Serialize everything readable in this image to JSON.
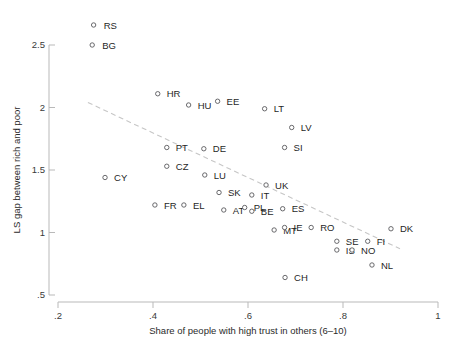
{
  "chart_data": {
    "type": "scatter",
    "title": "",
    "xlabel": "Share of people with high trust in others (6–10)",
    "ylabel": "LS gap between rich and poor",
    "xlim": [
      0.2,
      1.0
    ],
    "ylim": [
      0.5,
      2.7
    ],
    "xticks": [
      0.2,
      0.4,
      0.6,
      0.8,
      1
    ],
    "xticklabels": [
      ".2",
      ".4",
      ".6",
      ".8",
      "1"
    ],
    "yticks": [
      0.5,
      1,
      1.5,
      2,
      2.5
    ],
    "yticklabels": [
      ".5",
      "1",
      "1.5",
      "2",
      "2.5"
    ],
    "grid": false,
    "legend": "none",
    "marker": "open-circle",
    "points": [
      {
        "label": "RS",
        "x": 0.275,
        "y": 2.66,
        "lx": 10,
        "ly": 3.5
      },
      {
        "label": "BG",
        "x": 0.272,
        "y": 2.5,
        "lx": 10,
        "ly": 3.5
      },
      {
        "label": "HR",
        "x": 0.41,
        "y": 2.11,
        "lx": 9,
        "ly": 3.5
      },
      {
        "label": "HU",
        "x": 0.475,
        "y": 2.02,
        "lx": 9,
        "ly": 3.5
      },
      {
        "label": "EE",
        "x": 0.536,
        "y": 2.05,
        "lx": 9,
        "ly": 3.5
      },
      {
        "label": "LT",
        "x": 0.635,
        "y": 1.99,
        "lx": 9,
        "ly": 3.5
      },
      {
        "label": "LV",
        "x": 0.692,
        "y": 1.84,
        "lx": 9,
        "ly": 3.5
      },
      {
        "label": "PT",
        "x": 0.429,
        "y": 1.68,
        "lx": 9,
        "ly": 3.5
      },
      {
        "label": "DE",
        "x": 0.507,
        "y": 1.67,
        "lx": 9,
        "ly": 3.5
      },
      {
        "label": "SI",
        "x": 0.677,
        "y": 1.68,
        "lx": 9,
        "ly": 3.5
      },
      {
        "label": "CZ",
        "x": 0.429,
        "y": 1.53,
        "lx": 9,
        "ly": 3.5
      },
      {
        "label": "CY",
        "x": 0.299,
        "y": 1.44,
        "lx": 9,
        "ly": 3.5
      },
      {
        "label": "LU",
        "x": 0.509,
        "y": 1.46,
        "lx": 9,
        "ly": 3.5
      },
      {
        "label": "UK",
        "x": 0.638,
        "y": 1.38,
        "lx": 9,
        "ly": 3.5
      },
      {
        "label": "SK",
        "x": 0.539,
        "y": 1.32,
        "lx": 9,
        "ly": 3.5
      },
      {
        "label": "IT",
        "x": 0.608,
        "y": 1.3,
        "lx": 9,
        "ly": 3.5
      },
      {
        "label": "ES",
        "x": 0.673,
        "y": 1.19,
        "lx": 9,
        "ly": 3.5
      },
      {
        "label": "FR",
        "x": 0.404,
        "y": 1.22,
        "lx": 9,
        "ly": 3.5
      },
      {
        "label": "EL",
        "x": 0.465,
        "y": 1.22,
        "lx": 9,
        "ly": 3.5
      },
      {
        "label": "AT",
        "x": 0.549,
        "y": 1.18,
        "lx": 9,
        "ly": 3.5
      },
      {
        "label": "PL",
        "x": 0.593,
        "y": 1.2,
        "lx": 9,
        "ly": 3.5
      },
      {
        "label": "BE",
        "x": 0.608,
        "y": 1.17,
        "lx": 9,
        "ly": 3.5
      },
      {
        "label": "MT",
        "x": 0.655,
        "y": 1.02,
        "lx": 9,
        "ly": 3.5
      },
      {
        "label": "IE",
        "x": 0.677,
        "y": 1.04,
        "lx": 9,
        "ly": 3.5
      },
      {
        "label": "RO",
        "x": 0.733,
        "y": 1.04,
        "lx": 9,
        "ly": 3.5
      },
      {
        "label": "DK",
        "x": 0.901,
        "y": 1.03,
        "lx": 9,
        "ly": 3.5
      },
      {
        "label": "SE",
        "x": 0.787,
        "y": 0.93,
        "lx": 9,
        "ly": 3.5
      },
      {
        "label": "FI",
        "x": 0.852,
        "y": 0.93,
        "lx": 9,
        "ly": 3.5
      },
      {
        "label": "IS",
        "x": 0.787,
        "y": 0.86,
        "lx": 9,
        "ly": 3.5
      },
      {
        "label": "NO",
        "x": 0.819,
        "y": 0.86,
        "lx": 9,
        "ly": 3.5
      },
      {
        "label": "NL",
        "x": 0.861,
        "y": 0.74,
        "lx": 9,
        "ly": 3.5
      },
      {
        "label": "CH",
        "x": 0.678,
        "y": 0.64,
        "lx": 9,
        "ly": 3.5
      }
    ],
    "fit_line": {
      "style": "dashed",
      "x0": 0.263,
      "y0": 2.04,
      "x1": 0.92,
      "y1": 0.87
    }
  }
}
